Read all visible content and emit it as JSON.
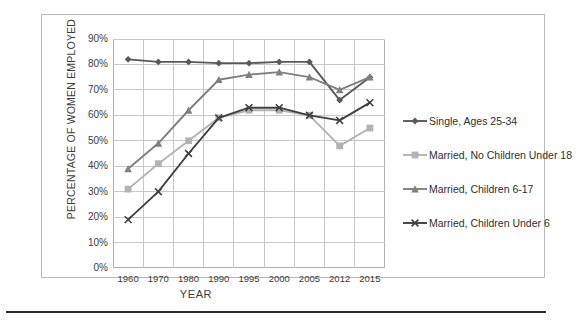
{
  "chart_data": {
    "type": "line",
    "title": "",
    "xlabel": "YEAR",
    "ylabel": "PERCENTAGE OF WOMEN EMPLOYED",
    "categories": [
      "1960",
      "1970",
      "1980",
      "1990",
      "1995",
      "2000",
      "2005",
      "2012",
      "2015"
    ],
    "ylim": [
      0,
      90
    ],
    "ytick_labels": [
      "0%",
      "10%",
      "20%",
      "30%",
      "40%",
      "50%",
      "60%",
      "70%",
      "80%",
      "90%"
    ],
    "ytick_values": [
      0,
      10,
      20,
      30,
      40,
      50,
      60,
      70,
      80,
      90
    ],
    "grid": true,
    "legend_position": "right",
    "series": [
      {
        "name": "Single, Ages 25-34",
        "color": "#595959",
        "marker": "diamond",
        "values": [
          82,
          81,
          81,
          80.5,
          80.5,
          81,
          81,
          66,
          75
        ]
      },
      {
        "name": "Married, No Children Under 18",
        "color": "#b3b3b3",
        "marker": "square",
        "values": [
          31,
          41,
          50,
          59,
          62,
          62,
          60,
          48,
          55
        ]
      },
      {
        "name": "Married, Children 6-17",
        "color": "#808080",
        "marker": "triangle",
        "values": [
          39,
          49,
          62,
          74,
          76,
          77,
          75,
          70,
          75
        ]
      },
      {
        "name": "Married, Children Under 6",
        "color": "#404040",
        "marker": "x",
        "values": [
          19,
          30,
          45,
          59,
          63,
          63,
          60,
          58,
          65
        ]
      }
    ]
  },
  "axis": {
    "x_title": "YEAR",
    "y_title": "PERCENTAGE OF WOMEN EMPLOYED"
  }
}
